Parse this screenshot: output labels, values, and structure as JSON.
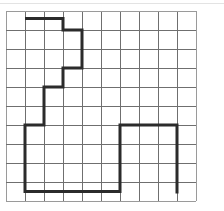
{
  "figure": {
    "background_color": "#ffffff"
  },
  "grid": {
    "columns": 10,
    "rows": 10,
    "cell_size": 19,
    "origin_x": 6,
    "origin_y": 11,
    "line_color": "#6f6f6f",
    "edge_color": "#9a9a9a",
    "show_grid": true
  },
  "path": {
    "name": "staircase-polyline",
    "stroke_color": "#2b2b2b",
    "stroke_width": 3,
    "closed": false,
    "points_grid": [
      [
        1.0,
        0.4
      ],
      [
        3.0,
        0.4
      ],
      [
        3.0,
        1.0
      ],
      [
        4.0,
        1.0
      ],
      [
        4.0,
        3.0
      ],
      [
        3.0,
        3.0
      ],
      [
        3.0,
        4.0
      ],
      [
        2.0,
        4.0
      ],
      [
        2.0,
        6.0
      ],
      [
        1.0,
        6.0
      ],
      [
        1.0,
        9.5
      ],
      [
        6.0,
        9.5
      ],
      [
        6.0,
        6.0
      ],
      [
        9.0,
        6.0
      ],
      [
        9.0,
        9.6
      ]
    ]
  },
  "chart_data": {
    "type": "line",
    "title": "",
    "xlabel": "",
    "ylabel": "",
    "xlim": [
      0,
      10
    ],
    "ylim": [
      0,
      10
    ],
    "grid": true,
    "legend": "none",
    "series": [
      {
        "name": "path",
        "x": [
          1.0,
          3.0,
          3.0,
          4.0,
          4.0,
          3.0,
          3.0,
          2.0,
          2.0,
          1.0,
          1.0,
          6.0,
          6.0,
          9.0,
          9.0
        ],
        "y": [
          0.4,
          0.4,
          1.0,
          1.0,
          3.0,
          3.0,
          4.0,
          4.0,
          6.0,
          6.0,
          9.5,
          9.5,
          6.0,
          6.0,
          9.6
        ]
      }
    ]
  }
}
